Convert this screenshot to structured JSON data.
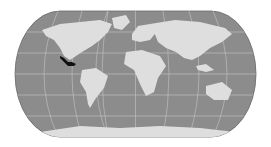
{
  "map": {
    "projection": "pseudo-cylindrical world map",
    "highlighted_region": "Mexico",
    "colors": {
      "background": "#ffffff",
      "ocean": "#8c8c8c",
      "land": "#dedede",
      "graticule": "#d9d9d9",
      "highlight": "#111111",
      "outline": "#6a6a6a"
    }
  }
}
